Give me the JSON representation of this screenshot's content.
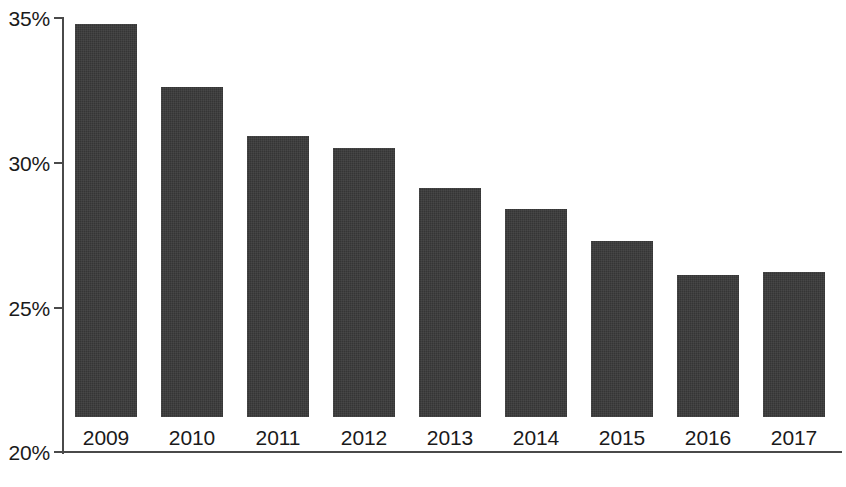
{
  "chart_data": {
    "type": "bar",
    "title": "",
    "subtitle": "",
    "xlabel": "",
    "ylabel": "",
    "categories": [
      "2009",
      "2010",
      "2011",
      "2012",
      "2013",
      "2014",
      "2015",
      "2016",
      "2017"
    ],
    "values": [
      33.6,
      31.4,
      29.7,
      29.3,
      27.9,
      27.2,
      26.1,
      24.9,
      25.0
    ],
    "value_suffix": "%",
    "ylim": [
      20,
      35
    ],
    "y_ticks": [
      20,
      25,
      30,
      35
    ],
    "y_tick_labels": [
      "20%",
      "25%",
      "30%",
      "35%"
    ],
    "grid": false,
    "legend": null,
    "legend_position": "none",
    "series": [
      {
        "name": "",
        "values": [
          33.6,
          31.4,
          29.7,
          29.3,
          27.9,
          27.2,
          26.1,
          24.9,
          25.0
        ]
      }
    ],
    "colors": {
      "bar": "#353535",
      "axis": "#4a4a4a",
      "text": "#1a1a1a",
      "background": "#ffffff"
    }
  },
  "axis": {
    "y_tick_labels": {
      "t35": "35%",
      "t30": "30%",
      "t25": "25%",
      "t20": "20%"
    }
  },
  "x_labels": {
    "c0": "2009",
    "c1": "2010",
    "c2": "2011",
    "c3": "2012",
    "c4": "2013",
    "c5": "2014",
    "c6": "2015",
    "c7": "2016",
    "c8": "2017"
  }
}
